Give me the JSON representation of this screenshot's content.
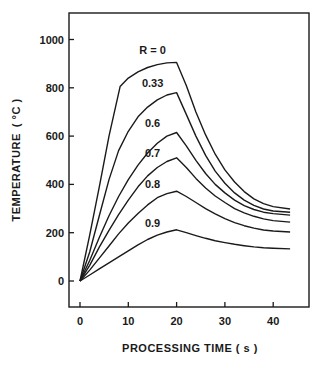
{
  "chart_data": {
    "type": "line",
    "title": "",
    "xlabel": "PROCESSING TIME ( s )",
    "ylabel": "TEMPERATURE ( °C )",
    "xlim": [
      -3,
      48
    ],
    "ylim": [
      -100,
      1120
    ],
    "xticks": [
      0,
      10,
      20,
      30,
      40
    ],
    "yticks": [
      0,
      200,
      400,
      600,
      800,
      1000
    ],
    "grid": false,
    "legend": "inline labels",
    "series": [
      {
        "name": "R = 0",
        "label_pos": [
          20,
          955
        ],
        "x": [
          0,
          2,
          4,
          6,
          8.3,
          10,
          12,
          14,
          16,
          18,
          20,
          22,
          24,
          26,
          28,
          30,
          32,
          34,
          36,
          38,
          40,
          43.5
        ],
        "y": [
          0,
          190,
          390,
          600,
          805,
          840,
          866,
          884,
          896,
          903,
          905,
          810,
          700,
          605,
          525,
          460,
          410,
          370,
          340,
          320,
          308,
          298
        ]
      },
      {
        "name": "0.33",
        "label_pos": [
          20,
          820
        ],
        "x": [
          0,
          2,
          4,
          6,
          8,
          10,
          12,
          14,
          16,
          18,
          20,
          22,
          24,
          26,
          28,
          30,
          32,
          34,
          36,
          38,
          40,
          43.5
        ],
        "y": [
          0,
          120,
          270,
          420,
          540,
          620,
          680,
          720,
          750,
          770,
          780,
          690,
          600,
          520,
          455,
          405,
          365,
          335,
          313,
          298,
          290,
          285
        ]
      },
      {
        "name": "0.6",
        "label_pos": [
          20,
          655
        ],
        "x": [
          0,
          2,
          4,
          6,
          8,
          10,
          12,
          14,
          16,
          18,
          20,
          22,
          24,
          26,
          28,
          30,
          32,
          34,
          36,
          38,
          40,
          43.5
        ],
        "y": [
          0,
          85,
          180,
          270,
          350,
          420,
          480,
          530,
          570,
          600,
          615,
          560,
          500,
          445,
          400,
          365,
          335,
          312,
          296,
          285,
          279,
          273
        ]
      },
      {
        "name": "0.7",
        "label_pos": [
          20,
          530
        ],
        "x": [
          0,
          2,
          4,
          6,
          8,
          10,
          12,
          14,
          16,
          18,
          20,
          22,
          24,
          26,
          28,
          30,
          32,
          34,
          36,
          38,
          40,
          43.5
        ],
        "y": [
          0,
          65,
          140,
          210,
          275,
          335,
          390,
          435,
          470,
          495,
          510,
          470,
          425,
          385,
          352,
          325,
          300,
          282,
          268,
          257,
          250,
          244
        ]
      },
      {
        "name": "0.8",
        "label_pos": [
          20,
          400
        ],
        "x": [
          0,
          2,
          4,
          6,
          8,
          10,
          12,
          14,
          16,
          18,
          20,
          22,
          24,
          26,
          28,
          30,
          32,
          34,
          36,
          38,
          40,
          43.5
        ],
        "y": [
          0,
          45,
          95,
          145,
          195,
          240,
          280,
          315,
          345,
          362,
          372,
          350,
          325,
          300,
          278,
          258,
          242,
          229,
          219,
          211,
          207,
          203
        ]
      },
      {
        "name": "0.9",
        "label_pos": [
          20,
          240
        ],
        "x": [
          0,
          2,
          4,
          6,
          8,
          10,
          12,
          14,
          16,
          18,
          20,
          22,
          24,
          26,
          28,
          30,
          32,
          34,
          36,
          38,
          40,
          43.5
        ],
        "y": [
          0,
          25,
          50,
          75,
          100,
          125,
          150,
          172,
          190,
          203,
          212,
          200,
          188,
          177,
          167,
          159,
          152,
          146,
          141,
          138,
          136,
          133
        ]
      }
    ]
  },
  "axes": {
    "x_title": "PROCESSING TIME ( s )",
    "y_title_main": "TEMPERATURE",
    "y_title_unit": "( °C )"
  },
  "colors": {
    "line": "#1a1a1a",
    "background": "#ffffff"
  }
}
